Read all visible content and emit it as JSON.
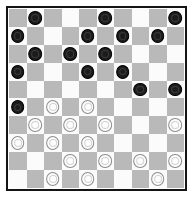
{
  "board": {
    "title": "International Draughts Board",
    "size": 10,
    "colors": {
      "light_square": "#fbfbfb",
      "dark_square": "#b9b9b9",
      "border": "#141414",
      "black_piece": "#1c1c1c",
      "white_piece": "#fdfdfd"
    },
    "piece_labels": {
      "black": "black-piece",
      "white": "white-piece",
      "empty": "empty-square"
    },
    "rows": [
      [
        null,
        "black",
        null,
        null,
        null,
        "black",
        null,
        null,
        null,
        "black"
      ],
      [
        "black",
        null,
        null,
        null,
        "black",
        null,
        "black",
        null,
        "black",
        null
      ],
      [
        null,
        "black",
        null,
        "black",
        null,
        "black",
        null,
        null,
        null,
        null
      ],
      [
        "black",
        null,
        null,
        null,
        "black",
        null,
        "black",
        null,
        null,
        null
      ],
      [
        null,
        null,
        null,
        null,
        null,
        null,
        null,
        "black",
        null,
        "black"
      ],
      [
        "black",
        null,
        "white",
        null,
        "white",
        null,
        null,
        null,
        null,
        null
      ],
      [
        null,
        "white",
        null,
        "white",
        null,
        "white",
        null,
        null,
        null,
        "white"
      ],
      [
        "white",
        null,
        "white",
        null,
        "white",
        null,
        null,
        null,
        null,
        null
      ],
      [
        null,
        null,
        null,
        "white",
        null,
        "white",
        null,
        "white",
        null,
        "white"
      ],
      [
        null,
        null,
        "white",
        null,
        "white",
        null,
        null,
        null,
        "white",
        null
      ]
    ]
  }
}
